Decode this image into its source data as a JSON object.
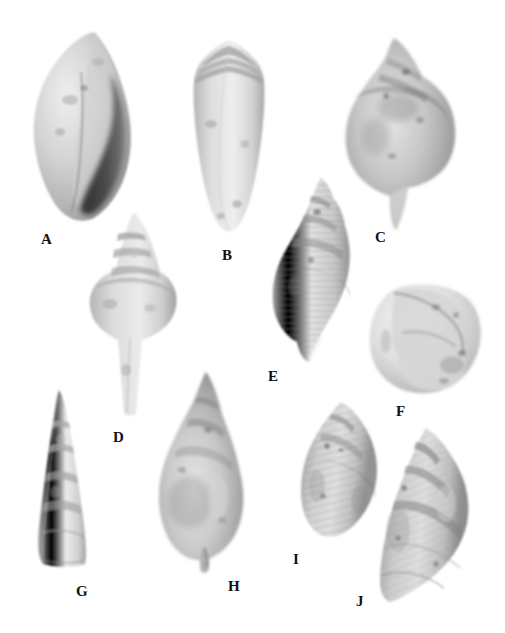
{
  "plate": {
    "title": "Fossil gastropod shell plate",
    "background_color": "#ffffff",
    "width": 505,
    "height": 633,
    "rendering": "grayscale photographic plate"
  },
  "specimens": [
    {
      "label": "A",
      "name": "fusiform-shell-with-dark-aperture",
      "shape": "elongate fusiform, broad body whorl, narrow pointed spire, large dark aperture on right margin",
      "label_x": 41,
      "label_y": 232,
      "box": {
        "x": 24,
        "y": 28,
        "w": 116,
        "h": 196
      },
      "tones": {
        "light": "#e3e2df",
        "mid": "#b9b8b4",
        "dark": "#8d8c89",
        "aperture": "#3b3a38"
      }
    },
    {
      "label": "B",
      "name": "conical-cone-shell",
      "shape": "conical cone shell, stepped low spire, tapering straight sides",
      "label_x": 222,
      "label_y": 248,
      "box": {
        "x": 181,
        "y": 36,
        "w": 96,
        "h": 198
      },
      "tones": {
        "light": "#e6e5e2",
        "mid": "#c4c3bf",
        "dark": "#949390",
        "aperture": "#6e6d6a"
      }
    },
    {
      "label": "C",
      "name": "large-whelk-shell",
      "shape": "large ovate whelk, knobbed shoulder, tall conical spire, long tapering anterior canal",
      "label_x": 375,
      "label_y": 230,
      "box": {
        "x": 336,
        "y": 36,
        "w": 130,
        "h": 196
      },
      "tones": {
        "light": "#dedcd8",
        "mid": "#aeada9",
        "dark": "#7f7e7b",
        "aperture": "#5e5d5a"
      }
    },
    {
      "label": "D",
      "name": "angulate-turrid-shell",
      "shape": "angulate shell with sharply shouldered body whorl, stepped spire and long narrow anterior canal",
      "label_x": 113,
      "label_y": 430,
      "box": {
        "x": 84,
        "y": 210,
        "w": 96,
        "h": 208
      },
      "tones": {
        "light": "#e0dfdc",
        "mid": "#b6b5b1",
        "dark": "#8a8986",
        "aperture": "#6b6a67"
      }
    },
    {
      "label": "E",
      "name": "ribbed-fusiform-shell",
      "shape": "fusiform shell with dense spiral ribbing, high turreted spire, narrow tapering base",
      "label_x": 268,
      "label_y": 369,
      "box": {
        "x": 265,
        "y": 176,
        "w": 92,
        "h": 190
      },
      "tones": {
        "light": "#dcdbd7",
        "mid": "#aaa9a5",
        "dark": "#7c7b78",
        "aperture": "#6a6966"
      }
    },
    {
      "label": "F",
      "name": "apertural-view-shell",
      "shape": "squat globose shell seen in apertural or apical view, broad rounded whorl wrapping around",
      "label_x": 396,
      "label_y": 404,
      "box": {
        "x": 366,
        "y": 281,
        "w": 118,
        "h": 116
      },
      "tones": {
        "light": "#eae9e6",
        "mid": "#cbcac6",
        "dark": "#a2a19d",
        "aperture": "#848380"
      }
    },
    {
      "label": "G",
      "name": "high-spired-turreted-shell",
      "shape": "tall narrow high-spired shell, flat-sided whorls with sharp sutures, apex pointed",
      "label_x": 76,
      "label_y": 584,
      "box": {
        "x": 25,
        "y": 388,
        "w": 70,
        "h": 182
      },
      "tones": {
        "light": "#e6e5e2",
        "mid": "#c7c6c2",
        "dark": "#9d9c99",
        "aperture": "#8a8986"
      }
    },
    {
      "label": "H",
      "name": "large-fusiform-shell-with-canal",
      "shape": "large fusiform shell, inflated body whorl, tall conical spire, short twisted anterior canal",
      "label_x": 228,
      "label_y": 579,
      "box": {
        "x": 152,
        "y": 370,
        "w": 100,
        "h": 206
      },
      "tones": {
        "light": "#dfdedb",
        "mid": "#b2b1ad",
        "dark": "#848380",
        "aperture": "#6d6c69"
      }
    },
    {
      "label": "I",
      "name": "ovate-ribbed-shell",
      "shape": "ovate shell with broad body whorl, spiral cords and short conical spire",
      "label_x": 293,
      "label_y": 552,
      "box": {
        "x": 297,
        "y": 400,
        "w": 86,
        "h": 144
      },
      "tones": {
        "light": "#ddDCd8",
        "mid": "#afaeaa",
        "dark": "#82817e",
        "aperture": "#6f6e6b"
      }
    },
    {
      "label": "J",
      "name": "spirally-corded-shell",
      "shape": "ovate-conical shell with strong spiral cords, stepped spire and broad body whorl",
      "label_x": 356,
      "label_y": 594,
      "box": {
        "x": 368,
        "y": 426,
        "w": 106,
        "h": 180
      },
      "tones": {
        "light": "#dbdad6",
        "mid": "#abaaa6",
        "dark": "#7e7d7a",
        "aperture": "#6a6966"
      }
    }
  ]
}
